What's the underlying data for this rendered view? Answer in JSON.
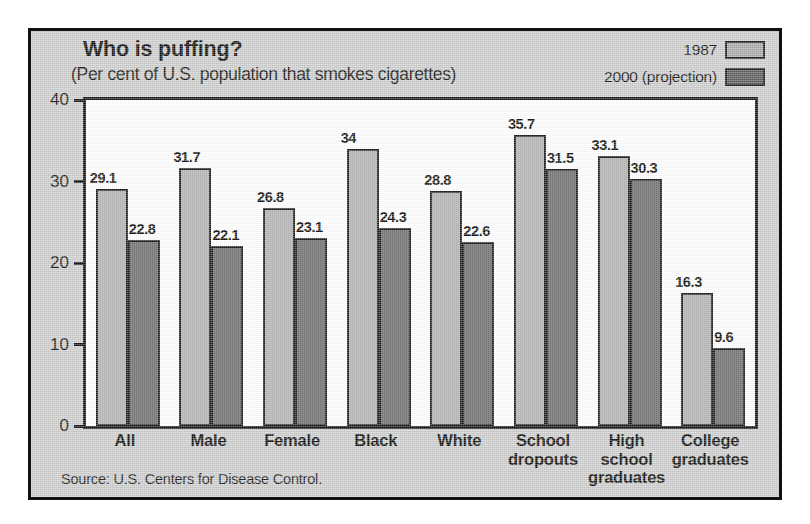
{
  "chart_data": {
    "type": "bar",
    "title": "Who is puffing?",
    "subtitle": "(Per cent of U.S. population that smokes cigarettes)",
    "xlabel": "",
    "ylabel": "",
    "ylim": [
      0,
      40
    ],
    "yticks": [
      0,
      10,
      20,
      30,
      40
    ],
    "ytick_labels": [
      "0",
      "10",
      "20",
      "30",
      "40"
    ],
    "grid": false,
    "legend_position": "top-right",
    "categories": [
      "All",
      "Male",
      "Female",
      "Black",
      "White",
      "School dropouts",
      "High school graduates",
      "College graduates"
    ],
    "category_lines": [
      [
        "All"
      ],
      [
        "Male"
      ],
      [
        "Female"
      ],
      [
        "Black"
      ],
      [
        "White"
      ],
      [
        "School",
        "dropouts"
      ],
      [
        "High",
        "school",
        "graduates"
      ],
      [
        "College",
        "graduates"
      ]
    ],
    "series": [
      {
        "name": "1987",
        "color": "#aaaaaa",
        "values": [
          29.1,
          31.7,
          26.8,
          34,
          28.8,
          35.7,
          33.1,
          16.3
        ],
        "labels": [
          "29.1",
          "31.7",
          "26.8",
          "34",
          "28.8",
          "35.7",
          "33.1",
          "16.3"
        ]
      },
      {
        "name": "2000 (projection)",
        "color": "#585858",
        "values": [
          22.8,
          22.1,
          23.1,
          24.3,
          22.6,
          31.5,
          30.3,
          9.6
        ],
        "labels": [
          "22.8",
          "22.1",
          "23.1",
          "24.3",
          "22.6",
          "31.5",
          "30.3",
          "9.6"
        ]
      }
    ],
    "source": "Source: U.S. Centers for Disease Control."
  },
  "legend": {
    "items": [
      {
        "label": "1987",
        "swatch": "#aaaaaa"
      },
      {
        "label": "2000 (projection)",
        "swatch": "#585858"
      }
    ]
  },
  "colors": {
    "panel_background": "#cdcdcd",
    "plot_background": "#ffffff",
    "frame": "#111111",
    "series_1987": "#aaaaaa",
    "series_2000": "#585858"
  }
}
